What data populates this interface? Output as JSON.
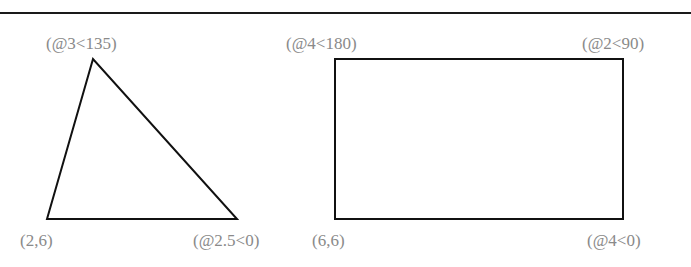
{
  "diagram": {
    "triangle": {
      "vertices": [
        [
          47,
          219
        ],
        [
          93,
          59
        ],
        [
          237,
          219
        ]
      ],
      "labels": {
        "start": "(2,6)",
        "second": "(@2.5<0)",
        "third": "(@3<135)"
      }
    },
    "rectangle": {
      "x": 335,
      "y": 59,
      "width": 288,
      "height": 160,
      "labels": {
        "start": "(6,6)",
        "second": "(@4<0)",
        "third": "(@2<90)",
        "fourth": "(@4<180)"
      }
    },
    "colors": {
      "stroke": "#111111",
      "label": "#8a8a8a",
      "rule": "#1a1a1a"
    }
  }
}
